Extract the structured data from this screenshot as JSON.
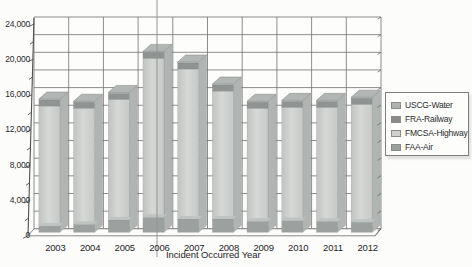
{
  "chart_data": {
    "type": "bar",
    "variant": "3d-stacked-column",
    "title": "",
    "xlabel": "Incident Occurred Year",
    "ylabel": "",
    "ylim": [
      0,
      24000
    ],
    "ytick_step": 4000,
    "grid_step": 2000,
    "grid": true,
    "legend_position": "right",
    "categories": [
      "2003",
      "2004",
      "2005",
      "2006",
      "2007",
      "2008",
      "2009",
      "2010",
      "2011",
      "2012"
    ],
    "ytick_labels": [
      "0",
      "4,000",
      "8,000",
      "12,000",
      "16,000",
      "20,000",
      "24,000"
    ],
    "series": [
      {
        "name": "FAA-Air",
        "color": "#9ca19f",
        "values": [
          700,
          900,
          1400,
          1700,
          1500,
          1500,
          1250,
          1350,
          1250,
          1150
        ]
      },
      {
        "name": "FMCSA-Highway",
        "color": "#cbcecc",
        "values": [
          13600,
          13150,
          13650,
          18000,
          17000,
          14500,
          12800,
          12800,
          12900,
          13350
        ]
      },
      {
        "name": "FRA-Railway",
        "color": "#8f9492",
        "values": [
          700,
          700,
          700,
          700,
          700,
          700,
          700,
          700,
          700,
          700
        ]
      },
      {
        "name": "USCG-Water",
        "color": "#c2c5c3",
        "values": [
          100,
          100,
          100,
          100,
          100,
          100,
          100,
          100,
          100,
          100
        ]
      }
    ],
    "totals_estimated": [
      15100,
      14850,
      15850,
      20500,
      19300,
      16800,
      14850,
      14950,
      14950,
      15300
    ]
  },
  "legend": {
    "items": [
      {
        "label": "USCG-Water",
        "color": "#aeb3b1"
      },
      {
        "label": "FRA-Railway",
        "color": "#888d8b"
      },
      {
        "label": "FMCSA-Highway",
        "color": "#ced1cf"
      },
      {
        "label": "FAA-Air",
        "color": "#9ba09e"
      }
    ]
  },
  "colors": {
    "grid": "#707070",
    "axis": "#4f4f4f",
    "bar_side": "#b0b4b2",
    "bar_cap": "#b2b6b4",
    "air_cap_sliver": "#bec2c0",
    "divider_artifact": "#949492",
    "highway_gradient": [
      "#c0c3c1",
      "#d6d8d6",
      "#c6c9c7"
    ]
  }
}
